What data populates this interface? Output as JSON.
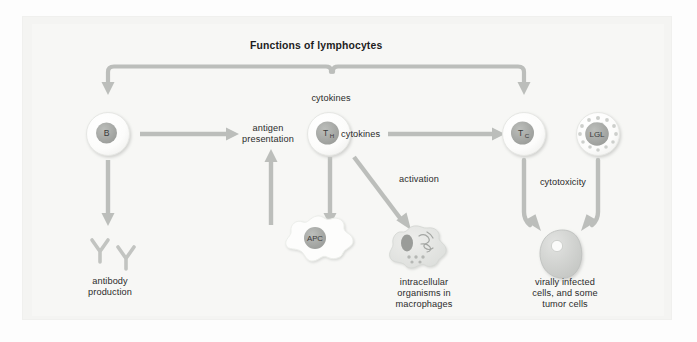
{
  "figure": {
    "title": "Functions of lymphocytes",
    "background_color": "#f7f7f5",
    "panel_color": "#f4f4f2",
    "arrow_color": "#b9bbb8",
    "cell_fill": "#ffffff",
    "nucleus_color": "#a9aba8",
    "text_color": "#2b2b2b"
  },
  "cells": {
    "b": {
      "label": "B",
      "sub": "",
      "name": "B lymphocyte"
    },
    "th": {
      "label": "T",
      "sub": "H",
      "name": "T helper cell"
    },
    "tc": {
      "label": "T",
      "sub": "C",
      "name": "T cytotoxic cell"
    },
    "lgl": {
      "label": "LGL",
      "sub": "",
      "name": "large granular lymphocyte"
    },
    "apc": {
      "label": "APC",
      "sub": "",
      "name": "antigen presenting cell"
    }
  },
  "labels": {
    "cytokines_top": "cytokines",
    "cytokines_right": "cytokines",
    "antigen_presentation": "antigen\npresentation",
    "activation": "activation",
    "cytotoxicity": "cytotoxicity",
    "antibody_production": "antibody\nproduction",
    "intracellular_organisms": "intracellular\norganisms in\nmacrophages",
    "virally_infected": "virally infected\ncells, and some\ntumor cells"
  },
  "arrows": [
    {
      "name": "th-to-b-cytokines",
      "from": "TH",
      "to": "B",
      "label": "cytokines"
    },
    {
      "name": "th-to-tc-cytokines",
      "from": "TH",
      "to": "Tc",
      "label": "cytokines"
    },
    {
      "name": "b-to-antigen-presentation",
      "from": "B",
      "to": "TH",
      "label": "antigen presentation"
    },
    {
      "name": "apc-to-th",
      "from": "APC",
      "to": "TH",
      "label": "antigen presentation"
    },
    {
      "name": "th-to-tc",
      "from": "TH",
      "to": "Tc",
      "label": "cytokines"
    },
    {
      "name": "th-to-apc",
      "from": "TH",
      "to": "APC",
      "label": ""
    },
    {
      "name": "th-to-macrophage",
      "from": "TH",
      "to": "macrophage",
      "label": "activation"
    },
    {
      "name": "b-to-antibody",
      "from": "B",
      "to": "antibody",
      "label": ""
    },
    {
      "name": "tc-to-target",
      "from": "Tc",
      "to": "target cell",
      "label": "cytotoxicity"
    },
    {
      "name": "lgl-to-target",
      "from": "LGL",
      "to": "target cell",
      "label": "cytotoxicity"
    }
  ]
}
